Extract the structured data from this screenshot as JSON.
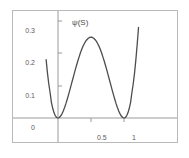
{
  "figure": {
    "background_color": "#ffffff",
    "frame_color": "#b9b9b9",
    "curve_color": "#4d4d4d",
    "axis_color": "#9a9a9a",
    "tick_color": "#9a9a9a",
    "label_color": "#5c5c5c"
  },
  "labels": {
    "y_axis_title": "ψ(S)",
    "x_axis_title": "S",
    "y_ticks": [
      "0.3",
      "0.2",
      "0.1",
      "0"
    ],
    "x_ticks": [
      "0.5",
      "1"
    ]
  },
  "chart_data": {
    "type": "line",
    "title": "",
    "subtitle": "",
    "xlabel": "S",
    "ylabel": "ψ(S)",
    "xlim": [
      -0.18,
      1.22
    ],
    "ylim": [
      -0.03,
      0.365
    ],
    "grid": false,
    "legend": null,
    "x_tick_values": [
      0.5,
      1
    ],
    "x_tick_labels": [
      "0.5",
      "1"
    ],
    "y_tick_values": [
      0,
      0.1,
      0.2,
      0.3
    ],
    "y_tick_labels": [
      "0",
      "0.1",
      "0.2",
      "0.3"
    ],
    "annotations": [
      {
        "text": "minimum",
        "x": 0,
        "y": 0
      },
      {
        "text": "local maximum",
        "x": 0.5,
        "y": 0.25
      },
      {
        "text": "minimum",
        "x": 1,
        "y": 0
      }
    ],
    "series": [
      {
        "name": "ψ(S)",
        "formula": "S^2 (1 - S)^2",
        "color": "#4d4d4d",
        "x": [
          -0.18,
          -0.16,
          -0.14,
          -0.12,
          -0.1,
          -0.08,
          -0.06,
          -0.04,
          -0.02,
          0.0,
          0.02,
          0.04,
          0.06,
          0.08,
          0.1,
          0.12,
          0.14,
          0.16,
          0.18,
          0.2,
          0.22,
          0.24,
          0.26,
          0.28,
          0.3,
          0.32,
          0.34,
          0.36,
          0.38,
          0.4,
          0.42,
          0.44,
          0.46,
          0.48,
          0.5,
          0.52,
          0.54,
          0.56,
          0.58,
          0.6,
          0.62,
          0.64,
          0.66,
          0.68,
          0.7,
          0.72,
          0.74,
          0.76,
          0.78,
          0.8,
          0.82,
          0.84,
          0.86,
          0.88,
          0.9,
          0.92,
          0.94,
          0.96,
          0.98,
          1.0,
          1.02,
          1.04,
          1.06,
          1.08,
          1.1,
          1.12,
          1.14,
          1.16,
          1.18,
          1.2,
          1.22
        ],
        "y": [
          0.0451,
          0.0349,
          0.0265,
          0.0197,
          0.0121,
          0.0075,
          0.004,
          0.0017,
          0.0004,
          0.0,
          0.0004,
          0.0015,
          0.0032,
          0.0054,
          0.0081,
          0.0111,
          0.0145,
          0.0181,
          0.0218,
          0.0256,
          0.0294,
          0.0332,
          0.037,
          0.0406,
          0.0441,
          0.0473,
          0.0504,
          0.0531,
          0.0556,
          0.0576,
          0.0594,
          0.0607,
          0.0617,
          0.0623,
          0.0625,
          0.0623,
          0.0617,
          0.0607,
          0.0594,
          0.0576,
          0.0556,
          0.0531,
          0.0504,
          0.0473,
          0.0441,
          0.0406,
          0.037,
          0.0332,
          0.0294,
          0.0256,
          0.0218,
          0.0181,
          0.0145,
          0.0111,
          0.0081,
          0.0054,
          0.0032,
          0.0015,
          0.0004,
          0.0,
          0.0004,
          0.0017,
          0.004,
          0.0075,
          0.0121,
          0.0197,
          0.0265,
          0.0349,
          0.0451,
          0.057,
          0.07
        ],
        "y_scaled_note": "displayed curve is 4x the quartic so peak reads 0.25 at S=0.5",
        "y_display": [
          0.1804,
          0.1396,
          0.106,
          0.0788,
          0.0484,
          0.03,
          0.016,
          0.0068,
          0.0016,
          0.0,
          0.0016,
          0.006,
          0.0128,
          0.0216,
          0.0324,
          0.0444,
          0.058,
          0.0724,
          0.0872,
          0.1024,
          0.1176,
          0.1328,
          0.148,
          0.1624,
          0.1764,
          0.1892,
          0.2016,
          0.2124,
          0.2224,
          0.2304,
          0.2376,
          0.2428,
          0.2468,
          0.2492,
          0.25,
          0.2492,
          0.2468,
          0.2428,
          0.2376,
          0.2304,
          0.2224,
          0.2124,
          0.2016,
          0.1892,
          0.1764,
          0.1624,
          0.148,
          0.1328,
          0.1176,
          0.1024,
          0.0872,
          0.0724,
          0.058,
          0.0444,
          0.0324,
          0.0216,
          0.0128,
          0.006,
          0.0016,
          0.0,
          0.0016,
          0.0068,
          0.016,
          0.03,
          0.0484,
          0.0788,
          0.106,
          0.1396,
          0.1804,
          0.228,
          0.28
        ]
      }
    ]
  }
}
